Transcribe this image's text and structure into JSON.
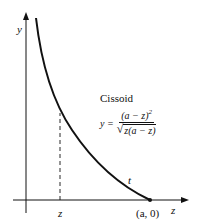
{
  "diagram": {
    "title": "Cissoid",
    "axes": {
      "y_label": "y",
      "x_label": "z"
    },
    "points": {
      "z_marker_label": "z",
      "endpoint_label": "(a, 0)"
    },
    "curve": {
      "name": "Cissoid",
      "tangent_label": "t"
    },
    "equation": {
      "lhs": "y =",
      "numerator": "(a − z)",
      "numerator_exp": "2",
      "denominator_radicand": "z(a − z)",
      "sqrt_symbol": "√"
    },
    "colors": {
      "line": "#111111",
      "background": "#ffffff"
    }
  }
}
